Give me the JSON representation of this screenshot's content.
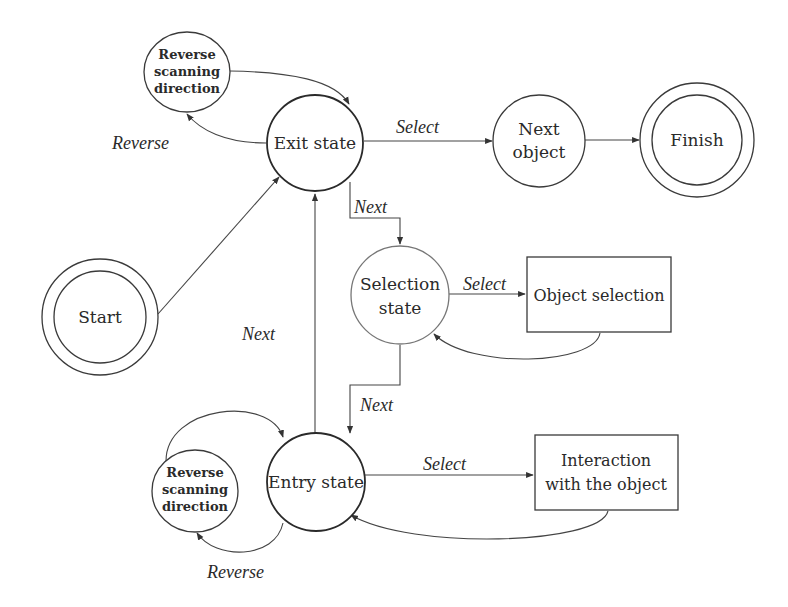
{
  "diagram": {
    "type": "state-transition",
    "nodes": {
      "reverse_top": {
        "label_lines": [
          "Reverse",
          "scanning",
          "direction"
        ],
        "shape": "circle",
        "bold": true
      },
      "exit_state": {
        "label": "Exit state",
        "shape": "circle"
      },
      "next_object": {
        "label_lines": [
          "Next",
          "object"
        ],
        "shape": "circle"
      },
      "finish": {
        "label": "Finish",
        "shape": "double-circle"
      },
      "start": {
        "label": "Start",
        "shape": "double-circle"
      },
      "selection_state": {
        "label_lines": [
          "Selection",
          "state"
        ],
        "shape": "circle"
      },
      "object_selection": {
        "label": "Object selection",
        "shape": "rectangle"
      },
      "entry_state": {
        "label": "Entry state",
        "shape": "circle"
      },
      "reverse_bottom": {
        "label_lines": [
          "Reverse",
          "scanning",
          "direction"
        ],
        "shape": "circle",
        "bold": true
      },
      "interaction": {
        "label_lines": [
          "Interaction",
          "with the object"
        ],
        "shape": "rectangle"
      }
    },
    "edge_labels": {
      "exit_reverse": "Reverse",
      "exit_select": "Select",
      "exit_next": "Next",
      "entry_next_up": "Next",
      "selection_select": "Select",
      "selection_next": "Next",
      "entry_select": "Select",
      "entry_reverse": "Reverse"
    },
    "edges": [
      {
        "from": "start",
        "to": "exit_state",
        "label": ""
      },
      {
        "from": "exit_state",
        "to": "reverse_top",
        "label": "Reverse"
      },
      {
        "from": "reverse_top",
        "to": "exit_state",
        "label": ""
      },
      {
        "from": "exit_state",
        "to": "next_object",
        "label": "Select"
      },
      {
        "from": "next_object",
        "to": "finish",
        "label": ""
      },
      {
        "from": "exit_state",
        "to": "selection_state",
        "label": "Next"
      },
      {
        "from": "selection_state",
        "to": "object_selection",
        "label": "Select"
      },
      {
        "from": "object_selection",
        "to": "selection_state",
        "label": ""
      },
      {
        "from": "selection_state",
        "to": "entry_state",
        "label": "Next"
      },
      {
        "from": "entry_state",
        "to": "exit_state",
        "label": "Next"
      },
      {
        "from": "entry_state",
        "to": "interaction",
        "label": "Select"
      },
      {
        "from": "interaction",
        "to": "entry_state",
        "label": ""
      },
      {
        "from": "entry_state",
        "to": "reverse_bottom",
        "label": "Reverse"
      },
      {
        "from": "reverse_bottom",
        "to": "entry_state",
        "label": ""
      }
    ]
  },
  "colors": {
    "stroke": "#3a3a3a",
    "text": "#2a2a2a",
    "background": "#ffffff"
  }
}
